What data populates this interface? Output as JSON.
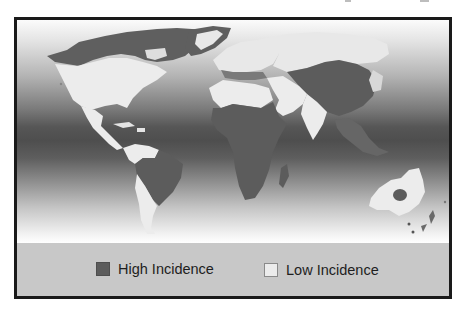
{
  "figure": {
    "type": "choropleth world map",
    "ocean_gradient": [
      "#fbfbfb",
      "#4e4e4e",
      "#ffffff"
    ],
    "colors": {
      "high": "#5c5c5c",
      "low": "#ececec",
      "legend_bg": "#c8c8c8",
      "frame_border": "#1a1a1a"
    }
  },
  "map": {
    "regions": [
      {
        "name": "Canada / Arctic North America",
        "category": "High Incidence"
      },
      {
        "name": "Greenland (interior)",
        "category": "Low Incidence"
      },
      {
        "name": "Greenland (coast)",
        "category": "High Incidence"
      },
      {
        "name": "United States",
        "category": "Low Incidence"
      },
      {
        "name": "Mexico & Central America",
        "category": "Low Incidence"
      },
      {
        "name": "Caribbean",
        "category": "Low Incidence"
      },
      {
        "name": "Northern South America",
        "category": "Low Incidence"
      },
      {
        "name": "Brazil / Central South America",
        "category": "High Incidence"
      },
      {
        "name": "Southern Cone (Chile / Argentina)",
        "category": "Low Incidence"
      },
      {
        "name": "Europe",
        "category": "Low Incidence"
      },
      {
        "name": "Southern Europe / Mediterranean rim",
        "category": "High Incidence"
      },
      {
        "name": "North Africa",
        "category": "Low Incidence"
      },
      {
        "name": "Sub-Saharan Africa",
        "category": "High Incidence"
      },
      {
        "name": "Madagascar",
        "category": "High Incidence"
      },
      {
        "name": "Middle East / Arabia",
        "category": "Low Incidence"
      },
      {
        "name": "Russia / Northern Asia",
        "category": "Low Incidence"
      },
      {
        "name": "Central & East Asia",
        "category": "High Incidence"
      },
      {
        "name": "India",
        "category": "Low Incidence"
      },
      {
        "name": "Southeast Asia",
        "category": "High Incidence"
      },
      {
        "name": "Australia",
        "category": "Low Incidence"
      },
      {
        "name": "Central Australia",
        "category": "High Incidence"
      },
      {
        "name": "New Zealand / Pacific islands",
        "category": "High Incidence"
      }
    ]
  },
  "legend": {
    "items": [
      {
        "label": "High Incidence",
        "swatch": "#5c5c5c"
      },
      {
        "label": "Low Incidence",
        "swatch": "#ececec"
      }
    ]
  }
}
